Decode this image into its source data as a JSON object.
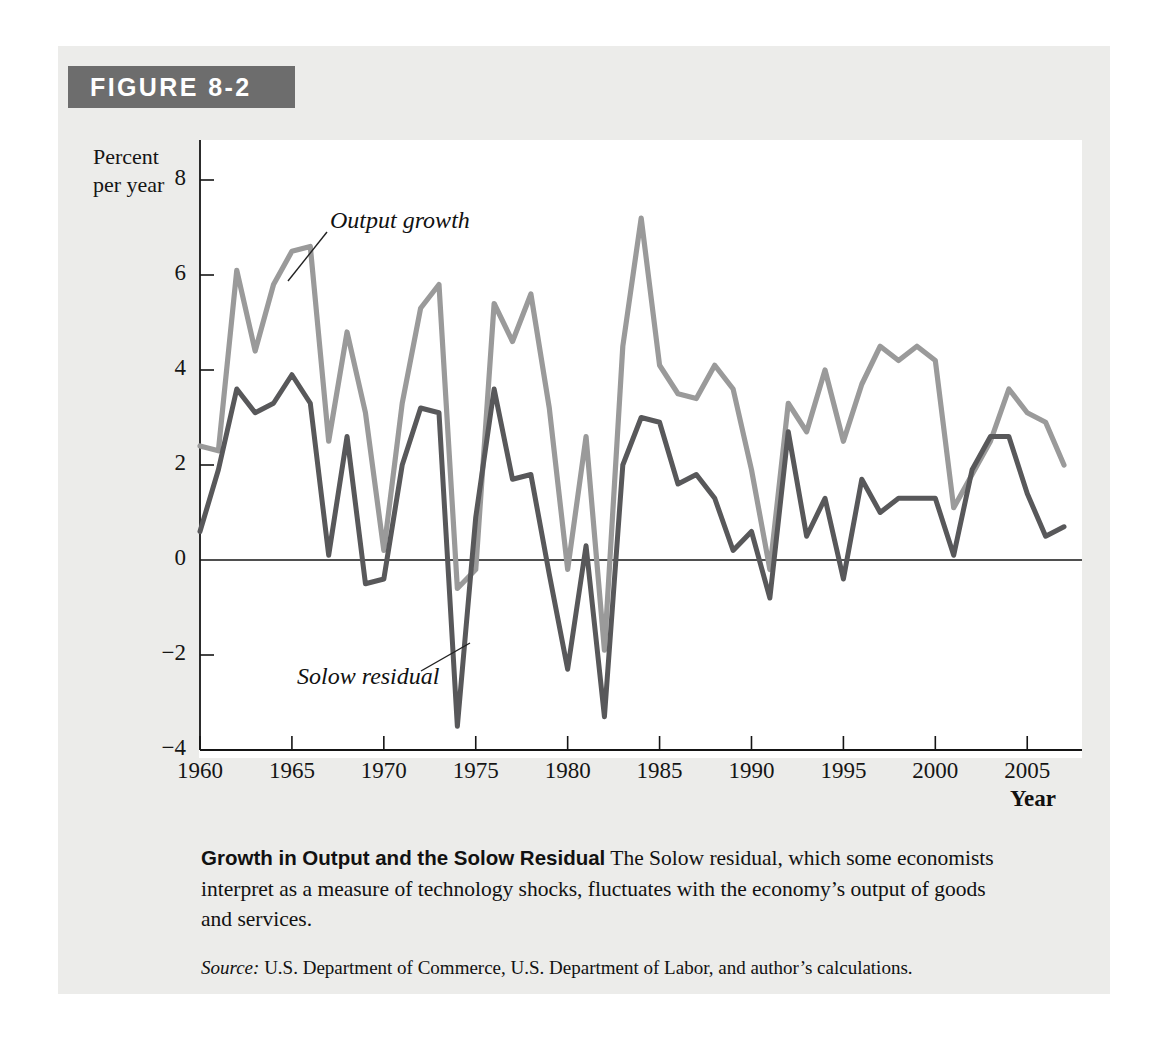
{
  "figure": {
    "banner_label": "FIGURE 8-2",
    "caption_title": "Growth in Output and the Solow Residual",
    "caption_body": " The Solow residual, which some economists interpret as a measure of technology shocks, fluctuates with the economy’s output of goods and services.",
    "source_lead": "Source:",
    "source_body": " U.S. Department of Commerce, U.S. Department of Labor, and author’s calculations."
  },
  "axes": {
    "ylabel_line1": "Percent",
    "ylabel_line2": "per year",
    "xlabel": "Year",
    "yticks": [
      "8",
      "6",
      "4",
      "2",
      "0",
      "−2",
      "−4"
    ],
    "xticks": [
      "1960",
      "1965",
      "1970",
      "1975",
      "1980",
      "1985",
      "1990",
      "1995",
      "2000",
      "2005"
    ]
  },
  "annotations": [
    {
      "text": "Output growth",
      "series": "output_growth"
    },
    {
      "text": "Solow residual",
      "series": "solow_residual"
    }
  ],
  "colors": {
    "panel_background": "#ececea",
    "banner_background": "#6d6d6d",
    "banner_text": "#ffffff",
    "plot_background": "#ffffff",
    "axis": "#151515",
    "output_growth_line": "#9a9a9a",
    "solow_residual_line": "#58585a",
    "text": "#111111"
  },
  "chart_data": {
    "type": "line",
    "title": "Growth in Output and the Solow Residual",
    "xlabel": "Year",
    "ylabel": "Percent per year",
    "xlim": [
      1960,
      2007
    ],
    "ylim": [
      -4,
      8
    ],
    "ytick_values": [
      8,
      6,
      4,
      2,
      0,
      -2,
      -4
    ],
    "xtick_values": [
      1960,
      1965,
      1970,
      1975,
      1980,
      1985,
      1990,
      1995,
      2000,
      2005
    ],
    "grid": false,
    "legend": "inline-annotations",
    "x": [
      1960,
      1961,
      1962,
      1963,
      1964,
      1965,
      1966,
      1967,
      1968,
      1969,
      1970,
      1971,
      1972,
      1973,
      1974,
      1975,
      1976,
      1977,
      1978,
      1979,
      1980,
      1981,
      1982,
      1983,
      1984,
      1985,
      1986,
      1987,
      1988,
      1989,
      1990,
      1991,
      1992,
      1993,
      1994,
      1995,
      1996,
      1997,
      1998,
      1999,
      2000,
      2001,
      2002,
      2003,
      2004,
      2005,
      2006,
      2007
    ],
    "series": [
      {
        "name": "Output growth",
        "color": "#9a9a9a",
        "values": [
          2.4,
          2.3,
          6.1,
          4.4,
          5.8,
          6.5,
          6.6,
          2.5,
          4.8,
          3.1,
          0.2,
          3.3,
          5.3,
          5.8,
          -0.6,
          -0.2,
          5.4,
          4.6,
          5.6,
          3.2,
          -0.2,
          2.6,
          -1.9,
          4.5,
          7.2,
          4.1,
          3.5,
          3.4,
          4.1,
          3.6,
          1.9,
          -0.2,
          3.3,
          2.7,
          4.0,
          2.5,
          3.7,
          4.5,
          4.2,
          4.5,
          4.2,
          1.1,
          1.8,
          2.5,
          3.6,
          3.1,
          2.9,
          2.0
        ]
      },
      {
        "name": "Solow residual",
        "color": "#58585a",
        "values": [
          0.6,
          1.9,
          3.6,
          3.1,
          3.3,
          3.9,
          3.3,
          0.1,
          2.6,
          -0.5,
          -0.4,
          2.0,
          3.2,
          3.1,
          -3.5,
          0.9,
          3.6,
          1.7,
          1.8,
          -0.3,
          -2.3,
          0.3,
          -3.3,
          2.0,
          3.0,
          2.9,
          1.6,
          1.8,
          1.3,
          0.2,
          0.6,
          -0.8,
          2.7,
          0.5,
          1.3,
          -0.4,
          1.7,
          1.0,
          1.3,
          1.3,
          1.3,
          0.1,
          1.9,
          2.6,
          2.6,
          1.4,
          0.5,
          0.7
        ]
      }
    ]
  }
}
